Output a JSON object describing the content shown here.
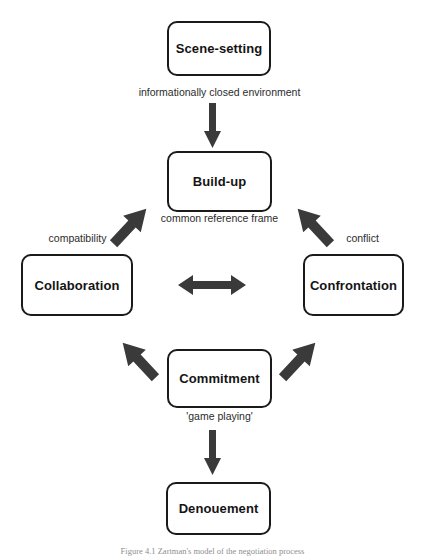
{
  "diagram": {
    "colors": {
      "node_border": "#1a1a1a",
      "node_fill": "#ffffff",
      "arrow": "#3a3a3a",
      "text": "#141414",
      "label_text": "#2b2b2b",
      "caption_text": "#8e8e8e"
    },
    "nodes": [
      {
        "id": "scene",
        "label": "Scene-setting"
      },
      {
        "id": "build",
        "label": "Build-up"
      },
      {
        "id": "collab",
        "label": "Collaboration"
      },
      {
        "id": "confront",
        "label": "Confrontation"
      },
      {
        "id": "commit",
        "label": "Commitment"
      },
      {
        "id": "denouement",
        "label": "Denouement"
      }
    ],
    "edge_labels": [
      {
        "id": "informational",
        "text": "informationally closed environment"
      },
      {
        "id": "common",
        "text": "common reference frame"
      },
      {
        "id": "compatibility",
        "text": "compatibility"
      },
      {
        "id": "conflict",
        "text": "conflict"
      },
      {
        "id": "game",
        "text": "'game playing'"
      }
    ],
    "arrows": [
      {
        "id": "scene-build",
        "from": "scene",
        "to": "build",
        "direction": "down"
      },
      {
        "id": "build-collab",
        "from": "build",
        "to": "collab",
        "direction": "down-left"
      },
      {
        "id": "build-confront",
        "from": "build",
        "to": "confront",
        "direction": "down-right"
      },
      {
        "id": "collab-confront",
        "from": "collab",
        "to": "confront",
        "direction": "bidirectional-horizontal"
      },
      {
        "id": "collab-commit",
        "from": "collab",
        "to": "commit",
        "direction": "down-right"
      },
      {
        "id": "confront-commit",
        "from": "confront",
        "to": "commit",
        "direction": "down-left"
      },
      {
        "id": "commit-denouement",
        "from": "commit",
        "to": "denouement",
        "direction": "down"
      }
    ],
    "caption": "Figure 4.1 Zartman's model of the negotiation process"
  }
}
